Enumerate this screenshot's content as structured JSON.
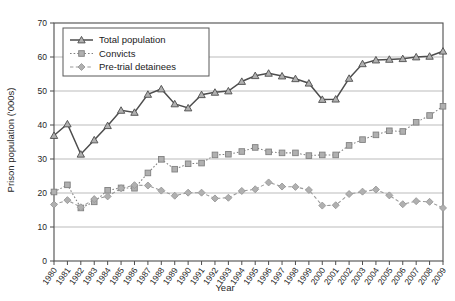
{
  "chart_data": {
    "type": "line",
    "title": "",
    "xlabel": "Year",
    "ylabel": "Prison population ('000s)",
    "ylim": [
      0,
      70
    ],
    "ytick_step": 10,
    "yticks": [
      0,
      10,
      20,
      30,
      40,
      50,
      60,
      70
    ],
    "grid": true,
    "legend_position": "top-left",
    "categories": [
      "1980",
      "1981",
      "1982",
      "1983",
      "1984",
      "1985",
      "1986",
      "1987",
      "1988",
      "1989",
      "1990",
      "1991",
      "1992",
      "1993",
      "1994",
      "1995",
      "1996",
      "1997",
      "1998",
      "1999",
      "2000",
      "2001",
      "2002",
      "2003",
      "2004",
      "2005",
      "2006",
      "2007",
      "2008",
      "2009"
    ],
    "series": [
      {
        "name": "Total population",
        "marker": "triangle",
        "linestyle": "solid",
        "color": "#4d4d4d",
        "values": [
          36.9,
          40.3,
          31.4,
          35.6,
          39.8,
          44.3,
          43.7,
          49.0,
          50.6,
          46.2,
          45.0,
          48.9,
          49.6,
          50.0,
          52.8,
          54.5,
          55.2,
          54.4,
          53.6,
          52.3,
          47.5,
          47.6,
          53.7,
          58.0,
          59.1,
          59.3,
          59.5,
          60.0,
          60.2,
          61.7
        ]
      },
      {
        "name": "Convicts",
        "marker": "square",
        "linestyle": "dotted",
        "color": "#808080",
        "values": [
          20.3,
          22.4,
          15.6,
          17.4,
          20.8,
          21.5,
          21.4,
          25.9,
          29.9,
          27.0,
          28.6,
          28.8,
          31.2,
          31.4,
          32.2,
          33.4,
          32.1,
          31.8,
          31.8,
          31.0,
          31.2,
          31.2,
          34.0,
          35.7,
          37.1,
          38.3,
          38.1,
          40.8,
          42.8,
          45.5
        ]
      },
      {
        "name": "Pre-trial detainees",
        "marker": "diamond",
        "linestyle": "dashed",
        "color": "#999999",
        "values": [
          16.6,
          17.9,
          15.8,
          18.2,
          19.0,
          21.4,
          22.3,
          22.2,
          20.7,
          19.2,
          20.1,
          20.1,
          18.4,
          18.6,
          20.6,
          21.1,
          23.1,
          21.9,
          21.8,
          20.9,
          16.3,
          16.4,
          19.7,
          20.4,
          21.0,
          19.3,
          16.7,
          17.6,
          17.4,
          15.6
        ]
      }
    ]
  },
  "legend": {
    "items": [
      {
        "label": "Total population"
      },
      {
        "label": "Convicts"
      },
      {
        "label": "Pre-trial detainees"
      }
    ]
  },
  "colors": {
    "total": "#4d4d4d",
    "convicts": "#808080",
    "detainees": "#999999",
    "grid": "#b3b3b3",
    "axis": "#4d4d4d",
    "marker_fill": "#b0b0b0"
  }
}
